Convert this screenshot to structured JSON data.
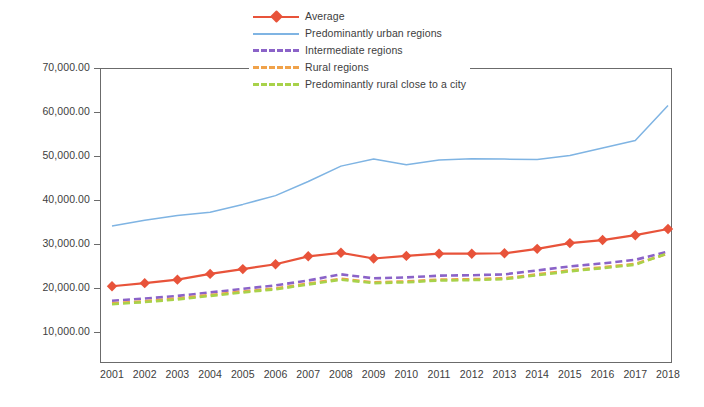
{
  "chart_data": {
    "type": "line",
    "title": "",
    "subtitle": "",
    "xlabel": "",
    "ylabel": "",
    "grid": false,
    "legend_position": "top-center",
    "ylim": [
      0,
      70000
    ],
    "ytick_labels": [
      "70,000.00",
      "60,000.00",
      "50,000.00",
      "40,000.00",
      "30,000.00",
      "20,000.00",
      "10,000.00"
    ],
    "ytick_values": [
      70000,
      60000,
      50000,
      40000,
      30000,
      20000,
      10000
    ],
    "categories": [
      "2001",
      "2002",
      "2003",
      "2004",
      "2005",
      "2006",
      "2007",
      "2008",
      "2009",
      "2010",
      "2011",
      "2012",
      "2013",
      "2014",
      "2015",
      "2016",
      "2017",
      "2018"
    ],
    "x": [
      2001,
      2002,
      2003,
      2004,
      2005,
      2006,
      2007,
      2008,
      2009,
      2010,
      2011,
      2012,
      2013,
      2014,
      2015,
      2016,
      2017,
      2018
    ],
    "series": [
      {
        "name": "Average",
        "color": "#e8533a",
        "style": "solid",
        "marker": "diamond",
        "values": [
          20400,
          21100,
          21900,
          23200,
          24300,
          25400,
          27200,
          28000,
          26700,
          27300,
          27800,
          27800,
          27900,
          28900,
          30200,
          30900,
          32000,
          33400
        ]
      },
      {
        "name": "Predominantly urban regions",
        "color": "#7fb4e3",
        "style": "solid",
        "marker": "none",
        "values": [
          34100,
          35400,
          36500,
          37200,
          39000,
          41000,
          44200,
          47700,
          49300,
          48000,
          49100,
          49400,
          49300,
          49200,
          50100,
          51800,
          53500,
          61500
        ]
      },
      {
        "name": "Intermediate regions",
        "color": "#8b63c8",
        "style": "dashed",
        "marker": "none",
        "values": [
          17100,
          17600,
          18200,
          19000,
          19800,
          20600,
          21700,
          23100,
          22200,
          22400,
          22800,
          22900,
          23100,
          24000,
          24900,
          25600,
          26400,
          28300
        ]
      },
      {
        "name": "Rural regions",
        "color": "#f0a24a",
        "style": "dashed",
        "marker": "none",
        "values": [
          16500,
          17000,
          17600,
          18400,
          19200,
          19900,
          21000,
          22100,
          21300,
          21500,
          21900,
          22000,
          22200,
          23100,
          24000,
          24700,
          25500,
          27800
        ]
      },
      {
        "name": "Predominantly rural close to a city",
        "color": "#a8d24a",
        "style": "dashed",
        "marker": "none",
        "values": [
          16300,
          16800,
          17400,
          18200,
          19000,
          19700,
          20800,
          21900,
          21100,
          21300,
          21700,
          21800,
          22000,
          22900,
          23800,
          24500,
          25300,
          27900
        ]
      }
    ]
  },
  "legend": {
    "items": [
      {
        "label": "Average"
      },
      {
        "label": "Predominantly urban regions"
      },
      {
        "label": "Intermediate regions"
      },
      {
        "label": "Rural regions"
      },
      {
        "label": "Predominantly rural close to a city"
      }
    ]
  },
  "colors": {
    "average": "#e8533a",
    "urban": "#7fb4e3",
    "intermediate": "#8b63c8",
    "rural": "#f0a24a",
    "rural_close_city": "#a8d24a",
    "axis": "#6b6b6b",
    "text": "#3d3d3d",
    "background": "#ffffff"
  }
}
